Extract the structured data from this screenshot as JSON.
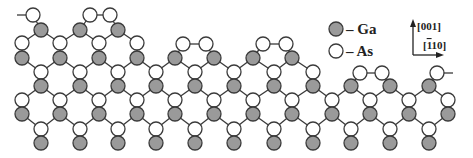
{
  "legend": {
    "items": [
      {
        "species": "Ga",
        "label": "– Ga",
        "fill": "#9a9a9a",
        "x": 336,
        "y": 29
      },
      {
        "species": "As",
        "label": "– As",
        "fill": "#ffffff",
        "x": 336,
        "y": 51
      }
    ]
  },
  "axes": {
    "vertical_label": "[001]",
    "horizontal_label": "[ī10]",
    "horizontal_label_parts": {
      "open": "[",
      "bar_digit": "1",
      "rest": "10]"
    },
    "origin": [
      413,
      55
    ],
    "up_end": [
      413,
      21
    ],
    "right_end": [
      442,
      55
    ]
  },
  "colors": {
    "ga_fill": "#9a9a9a",
    "as_fill": "#ffffff",
    "outline": "#3a3a3a"
  },
  "lattice": {
    "atom_radius": 7,
    "columns_A": [
      41,
      80,
      118,
      156,
      195,
      234,
      274,
      313,
      351,
      390,
      429
    ],
    "columns_B": [
      22,
      60,
      99,
      137,
      175,
      214,
      253,
      292,
      332,
      370,
      409,
      448
    ],
    "atoms": [
      {
        "s": "As",
        "x": 33,
        "y": 15
      },
      {
        "s": "As",
        "x": 90,
        "y": 15
      },
      {
        "s": "As",
        "x": 110,
        "y": 15
      },
      {
        "s": "Ga",
        "x": 41,
        "y": 30
      },
      {
        "s": "Ga",
        "x": 80,
        "y": 30
      },
      {
        "s": "Ga",
        "x": 118,
        "y": 30
      },
      {
        "s": "As",
        "x": 22,
        "y": 43
      },
      {
        "s": "As",
        "x": 60,
        "y": 43
      },
      {
        "s": "As",
        "x": 99,
        "y": 43
      },
      {
        "s": "As",
        "x": 137,
        "y": 43
      },
      {
        "s": "As",
        "x": 183,
        "y": 44
      },
      {
        "s": "As",
        "x": 206,
        "y": 44
      },
      {
        "s": "As",
        "x": 263,
        "y": 44
      },
      {
        "s": "As",
        "x": 286,
        "y": 44
      },
      {
        "s": "Ga",
        "x": 22,
        "y": 58
      },
      {
        "s": "Ga",
        "x": 60,
        "y": 58
      },
      {
        "s": "Ga",
        "x": 99,
        "y": 58
      },
      {
        "s": "Ga",
        "x": 137,
        "y": 58
      },
      {
        "s": "Ga",
        "x": 175,
        "y": 58
      },
      {
        "s": "Ga",
        "x": 214,
        "y": 58
      },
      {
        "s": "Ga",
        "x": 253,
        "y": 58
      },
      {
        "s": "Ga",
        "x": 292,
        "y": 58
      },
      {
        "s": "As",
        "x": 41,
        "y": 72
      },
      {
        "s": "As",
        "x": 80,
        "y": 72
      },
      {
        "s": "As",
        "x": 118,
        "y": 72
      },
      {
        "s": "As",
        "x": 156,
        "y": 72
      },
      {
        "s": "As",
        "x": 195,
        "y": 72
      },
      {
        "s": "As",
        "x": 234,
        "y": 72
      },
      {
        "s": "As",
        "x": 274,
        "y": 72
      },
      {
        "s": "As",
        "x": 313,
        "y": 72
      },
      {
        "s": "As",
        "x": 360,
        "y": 73
      },
      {
        "s": "As",
        "x": 382,
        "y": 73
      },
      {
        "s": "As",
        "x": 437,
        "y": 73
      },
      {
        "s": "Ga",
        "x": 41,
        "y": 86
      },
      {
        "s": "Ga",
        "x": 80,
        "y": 86
      },
      {
        "s": "Ga",
        "x": 118,
        "y": 86
      },
      {
        "s": "Ga",
        "x": 156,
        "y": 86
      },
      {
        "s": "Ga",
        "x": 195,
        "y": 86
      },
      {
        "s": "Ga",
        "x": 234,
        "y": 86
      },
      {
        "s": "Ga",
        "x": 274,
        "y": 86
      },
      {
        "s": "Ga",
        "x": 313,
        "y": 86
      },
      {
        "s": "Ga",
        "x": 351,
        "y": 86
      },
      {
        "s": "Ga",
        "x": 390,
        "y": 86
      },
      {
        "s": "Ga",
        "x": 429,
        "y": 86
      },
      {
        "s": "As",
        "x": 22,
        "y": 100
      },
      {
        "s": "As",
        "x": 60,
        "y": 100
      },
      {
        "s": "As",
        "x": 99,
        "y": 100
      },
      {
        "s": "As",
        "x": 137,
        "y": 100
      },
      {
        "s": "As",
        "x": 175,
        "y": 100
      },
      {
        "s": "As",
        "x": 214,
        "y": 100
      },
      {
        "s": "As",
        "x": 253,
        "y": 100
      },
      {
        "s": "As",
        "x": 292,
        "y": 100
      },
      {
        "s": "As",
        "x": 332,
        "y": 100
      },
      {
        "s": "As",
        "x": 370,
        "y": 100
      },
      {
        "s": "As",
        "x": 409,
        "y": 100
      },
      {
        "s": "As",
        "x": 448,
        "y": 100
      },
      {
        "s": "Ga",
        "x": 22,
        "y": 114
      },
      {
        "s": "Ga",
        "x": 60,
        "y": 114
      },
      {
        "s": "Ga",
        "x": 99,
        "y": 114
      },
      {
        "s": "Ga",
        "x": 137,
        "y": 114
      },
      {
        "s": "Ga",
        "x": 175,
        "y": 114
      },
      {
        "s": "Ga",
        "x": 214,
        "y": 114
      },
      {
        "s": "Ga",
        "x": 253,
        "y": 114
      },
      {
        "s": "Ga",
        "x": 292,
        "y": 114
      },
      {
        "s": "Ga",
        "x": 332,
        "y": 114
      },
      {
        "s": "Ga",
        "x": 370,
        "y": 114
      },
      {
        "s": "Ga",
        "x": 409,
        "y": 114
      },
      {
        "s": "Ga",
        "x": 448,
        "y": 114
      },
      {
        "s": "As",
        "x": 41,
        "y": 129
      },
      {
        "s": "As",
        "x": 80,
        "y": 129
      },
      {
        "s": "As",
        "x": 118,
        "y": 129
      },
      {
        "s": "As",
        "x": 156,
        "y": 129
      },
      {
        "s": "As",
        "x": 195,
        "y": 129
      },
      {
        "s": "As",
        "x": 234,
        "y": 129
      },
      {
        "s": "As",
        "x": 274,
        "y": 129
      },
      {
        "s": "As",
        "x": 313,
        "y": 129
      },
      {
        "s": "As",
        "x": 351,
        "y": 129
      },
      {
        "s": "As",
        "x": 390,
        "y": 129
      },
      {
        "s": "As",
        "x": 429,
        "y": 129
      },
      {
        "s": "Ga",
        "x": 41,
        "y": 143
      },
      {
        "s": "Ga",
        "x": 80,
        "y": 143
      },
      {
        "s": "Ga",
        "x": 118,
        "y": 143
      },
      {
        "s": "Ga",
        "x": 156,
        "y": 143
      },
      {
        "s": "Ga",
        "x": 195,
        "y": 143
      },
      {
        "s": "Ga",
        "x": 234,
        "y": 143
      },
      {
        "s": "Ga",
        "x": 274,
        "y": 143
      },
      {
        "s": "Ga",
        "x": 313,
        "y": 143
      },
      {
        "s": "Ga",
        "x": 351,
        "y": 143
      },
      {
        "s": "Ga",
        "x": 390,
        "y": 143
      },
      {
        "s": "Ga",
        "x": 429,
        "y": 143
      }
    ],
    "extra_bonds": [
      [
        17,
        15,
        33,
        15
      ],
      [
        33,
        15,
        41,
        30
      ],
      [
        90,
        15,
        110,
        15
      ],
      [
        90,
        15,
        80,
        30
      ],
      [
        110,
        15,
        118,
        30
      ],
      [
        183,
        44,
        206,
        44
      ],
      [
        183,
        44,
        175,
        58
      ],
      [
        206,
        44,
        214,
        58
      ],
      [
        263,
        44,
        286,
        44
      ],
      [
        263,
        44,
        253,
        58
      ],
      [
        286,
        44,
        292,
        58
      ],
      [
        360,
        73,
        382,
        73
      ],
      [
        360,
        73,
        351,
        86
      ],
      [
        382,
        73,
        390,
        86
      ],
      [
        437,
        73,
        453,
        73
      ],
      [
        437,
        73,
        429,
        86
      ]
    ]
  }
}
